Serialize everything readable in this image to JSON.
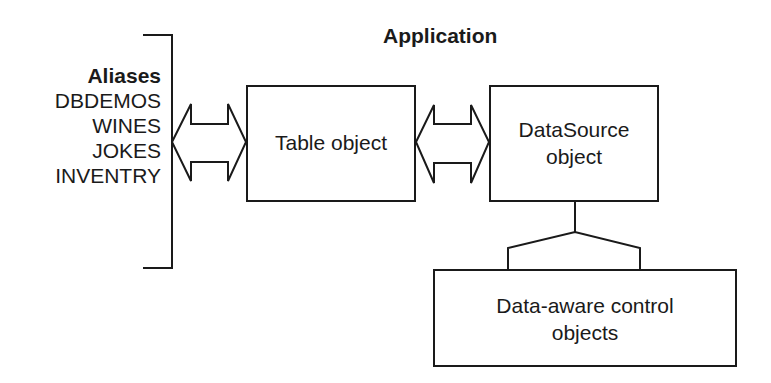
{
  "title": "Application",
  "aliases": {
    "header": "Aliases",
    "items": [
      "DBDEMOS",
      "WINES",
      "JOKES",
      "INVENTRY"
    ]
  },
  "nodes": {
    "table": {
      "label": "Table object"
    },
    "datasource": {
      "line1": "DataSource",
      "line2": "object"
    },
    "controls": {
      "line1": "Data-aware control",
      "line2": "objects"
    }
  },
  "edges": [
    {
      "from": "aliases",
      "to": "table",
      "type": "double-arrow"
    },
    {
      "from": "table",
      "to": "datasource",
      "type": "double-arrow"
    },
    {
      "from": "datasource",
      "to": "controls",
      "type": "fork-connector"
    }
  ],
  "colors": {
    "stroke": "#1a1a1a",
    "background": "#ffffff"
  }
}
